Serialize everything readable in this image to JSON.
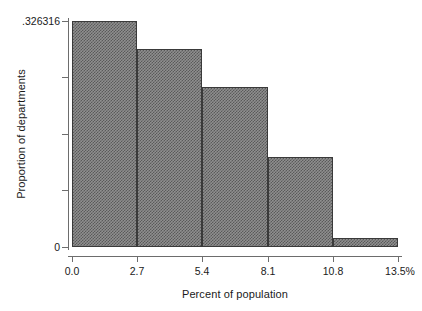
{
  "chart_data": {
    "type": "bar",
    "title": "",
    "subtitle": "",
    "xlabel": "Percent of population",
    "ylabel": "Proportion of departments",
    "categories": [
      "0.0-2.7",
      "2.7-5.4",
      "5.4-8.1",
      "8.1-10.8",
      "10.8-13.5"
    ],
    "values": [
      0.326316,
      0.286,
      0.231,
      0.13,
      0.013
    ],
    "bin_edges": [
      0.0,
      2.7,
      5.4,
      8.1,
      10.8,
      13.5
    ],
    "x_tick_labels": [
      "0.0",
      "2.7",
      "5.4",
      "8.1",
      "10.8",
      "13.5%"
    ],
    "x_tick_values": [
      0.0,
      2.7,
      5.4,
      8.1,
      10.8,
      13.5
    ],
    "y_tick_labels": [
      ".326316",
      "",
      "",
      "",
      "0"
    ],
    "y_tick_values": [
      0.326316,
      0.244737,
      0.163158,
      0.081579,
      0
    ],
    "xlim": [
      0.0,
      13.5
    ],
    "ylim": [
      0,
      0.326316
    ],
    "grid": false,
    "legend": false,
    "legend_position": "none",
    "bar_fill_color": "#8f8f8f",
    "bar_pattern": "crosshatch-checkerboard",
    "bar_edge_color": "#3a3a3a",
    "axis_color": "#6d6d6d",
    "background_color": "#ffffff"
  }
}
